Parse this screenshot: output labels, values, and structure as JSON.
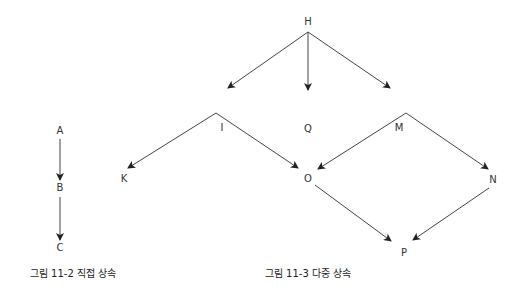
{
  "figures": [
    {
      "caption": "그림 11-2 직접 상속",
      "nodes": [
        {
          "id": "A",
          "label": "A",
          "x": 60,
          "y": 131
        },
        {
          "id": "B",
          "label": "B",
          "x": 60,
          "y": 188
        },
        {
          "id": "C",
          "label": "C",
          "x": 60,
          "y": 248
        }
      ],
      "edges": [
        {
          "from": "A",
          "to": "B",
          "x1": 60,
          "y1": 139,
          "x2": 60,
          "y2": 180
        },
        {
          "from": "B",
          "to": "C",
          "x1": 60,
          "y1": 197,
          "x2": 60,
          "y2": 240
        }
      ]
    },
    {
      "caption": "그림 11-3 다중 상속",
      "nodes": [
        {
          "id": "H",
          "label": "H",
          "x": 308,
          "y": 22
        },
        {
          "id": "I",
          "label": "I",
          "x": 222,
          "y": 128
        },
        {
          "id": "Q",
          "label": "Q",
          "x": 308,
          "y": 129
        },
        {
          "id": "M",
          "label": "M",
          "x": 399,
          "y": 128
        },
        {
          "id": "K",
          "label": "K",
          "x": 124,
          "y": 179
        },
        {
          "id": "O",
          "label": "O",
          "x": 308,
          "y": 179
        },
        {
          "id": "N",
          "label": "N",
          "x": 493,
          "y": 180
        },
        {
          "id": "P",
          "label": "P",
          "x": 404,
          "y": 253
        }
      ],
      "edges": [
        {
          "from": "H",
          "to": "I",
          "x1": 308,
          "y1": 32,
          "x2": 228,
          "y2": 88
        },
        {
          "from": "H",
          "to": "Q",
          "x1": 308,
          "y1": 32,
          "x2": 308,
          "y2": 90
        },
        {
          "from": "H",
          "to": "M",
          "x1": 308,
          "y1": 32,
          "x2": 390,
          "y2": 88
        },
        {
          "from": "I",
          "to": "K",
          "x1": 216,
          "y1": 113,
          "x2": 128,
          "y2": 168
        },
        {
          "from": "I",
          "to": "O",
          "x1": 216,
          "y1": 113,
          "x2": 298,
          "y2": 168
        },
        {
          "from": "M",
          "to": "O",
          "x1": 406,
          "y1": 113,
          "x2": 318,
          "y2": 169
        },
        {
          "from": "M",
          "to": "N",
          "x1": 406,
          "y1": 113,
          "x2": 488,
          "y2": 169
        },
        {
          "from": "O",
          "to": "P",
          "x1": 315,
          "y1": 185,
          "x2": 391,
          "y2": 241
        },
        {
          "from": "N",
          "to": "P",
          "x1": 489,
          "y1": 188,
          "x2": 413,
          "y2": 240
        }
      ]
    }
  ],
  "colors": {
    "line": "#444444",
    "text": "#333333",
    "background": "#ffffff"
  }
}
